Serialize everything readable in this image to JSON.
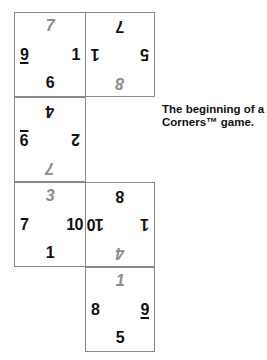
{
  "caption": {
    "line1": "The beginning of a",
    "line2": "Corners™ game."
  },
  "cards": [
    {
      "position": "row1-col1",
      "rotated": false,
      "top": "7",
      "left": "9",
      "left_underlined": true,
      "right": "1",
      "bottom": "6"
    },
    {
      "position": "row1-col2",
      "rotated": true,
      "top": "8",
      "left": "5",
      "right": "1",
      "bottom": "7"
    },
    {
      "position": "row2-col1",
      "rotated": true,
      "top": "7",
      "left": "2",
      "right": "9",
      "right_underlined": true,
      "bottom": "4"
    },
    {
      "position": "row3-col1",
      "rotated": false,
      "top": "3",
      "left": "7",
      "right": "10",
      "bottom": "1"
    },
    {
      "position": "row3-col2",
      "rotated": true,
      "top": "4",
      "left": "1",
      "right": "10",
      "bottom": "8"
    },
    {
      "position": "row4-col2",
      "rotated": false,
      "top": "1",
      "left": "8",
      "right": "9",
      "right_underlined": true,
      "bottom": "5"
    }
  ],
  "colors": {
    "border": "#8a8a8a",
    "corner_number": "#111111",
    "top_number": "#8c8c8c"
  }
}
